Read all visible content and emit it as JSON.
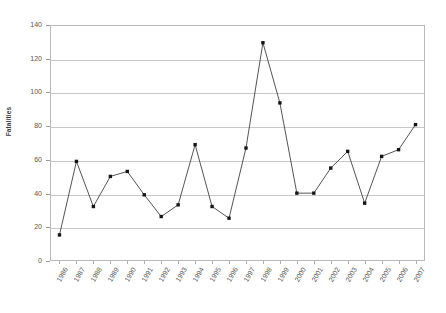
{
  "chart_data": {
    "type": "line",
    "title": "",
    "xlabel": "",
    "ylabel": "Fatalities",
    "categories": [
      "1986",
      "1987",
      "1988",
      "1989",
      "1990",
      "1991",
      "1992",
      "1993",
      "1994",
      "1995",
      "1996",
      "1997",
      "1998",
      "1999",
      "2000",
      "2001",
      "2002",
      "2003",
      "2004",
      "2005",
      "2006",
      "2007"
    ],
    "values": [
      15,
      59,
      32,
      50,
      53,
      39,
      26,
      33,
      69,
      32,
      25,
      67,
      130,
      94,
      40,
      40,
      55,
      65,
      34,
      62,
      66,
      81
    ],
    "series": [
      {
        "name": "Fatalities",
        "values": [
          15,
          59,
          32,
          50,
          53,
          39,
          26,
          33,
          69,
          32,
          25,
          67,
          130,
          94,
          40,
          40,
          55,
          65,
          34,
          62,
          66,
          81
        ]
      }
    ],
    "ylim": [
      0,
      140
    ],
    "y_ticks": [
      0,
      20,
      40,
      60,
      80,
      100,
      120,
      140
    ],
    "y_tick_labels": [
      "0",
      "20",
      "40",
      "60",
      "80",
      "100",
      "120",
      "140"
    ],
    "grid": "horizontal",
    "legend": "none",
    "marker": "square",
    "line_color": "#3f3f3f",
    "marker_color": "#151515",
    "gridline_color": "#c8c8c8",
    "frame_color": "#b9b9b9",
    "background": "#ffffff",
    "x_tick_rotation": -60
  }
}
